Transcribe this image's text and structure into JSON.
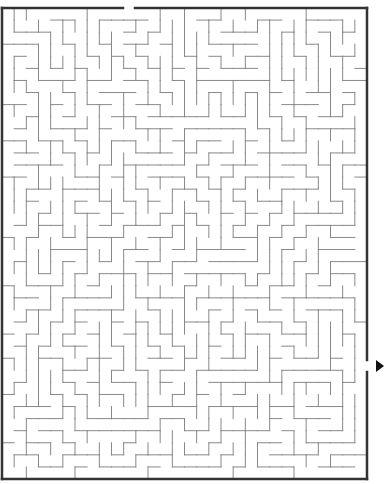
{
  "puzzle": {
    "title": "Maze",
    "type": "rectangular maze",
    "grid": {
      "cols": 30,
      "rows": 39
    },
    "bounds": {
      "left": 2,
      "top": 8,
      "right": 367,
      "bottom": 479
    },
    "entrance": {
      "side": "top",
      "from_x": 123,
      "to_x": 135
    },
    "exit": {
      "side": "right",
      "from_y": 360,
      "to_y": 372,
      "marker": "arrow-right"
    },
    "colors": {
      "border": "#333333",
      "wall": "#888888",
      "arrow": "#111111",
      "background": "#ffffff"
    },
    "seed": 7331
  }
}
